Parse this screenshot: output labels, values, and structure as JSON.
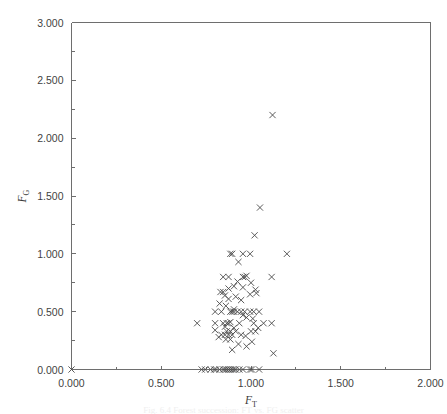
{
  "figure": {
    "background_color": "#ffffff",
    "frame_color": "#6e6e6e",
    "marker_color": "#4a4a4a",
    "caption": "Fig. 6.4  Forest succession: FT vs. FG scatter"
  },
  "axes": {
    "x_title_main": "F",
    "x_title_sub": "T",
    "y_title_main": "F",
    "y_title_sub": "G",
    "x_tick_labels": [
      "0.000",
      "0.500",
      "1.000",
      "1.500",
      "2.000"
    ],
    "y_tick_labels": [
      "0.000",
      "0.500",
      "1.000",
      "1.500",
      "2.000",
      "2.500",
      "3.000"
    ],
    "x_major_values": [
      0.0,
      0.5,
      1.0,
      1.5,
      2.0
    ],
    "y_major_values": [
      0.0,
      0.5,
      1.0,
      1.5,
      2.0,
      2.5,
      3.0
    ],
    "x_minor_values": [
      0.25,
      0.75,
      1.25,
      1.75
    ],
    "y_minor_values": [
      0.25,
      0.75,
      1.25,
      1.75,
      2.25,
      2.75
    ]
  },
  "chart_data": {
    "type": "scatter",
    "title": "",
    "xlabel": "F_T",
    "ylabel": "F_G",
    "xlim": [
      0.0,
      2.0
    ],
    "ylim": [
      0.0,
      3.0
    ],
    "grid": false,
    "legend": null,
    "marker": "x",
    "series": [
      {
        "name": "observations",
        "points": [
          [
            0.0,
            0.0
          ],
          [
            1.12,
            2.2
          ],
          [
            1.05,
            1.4
          ],
          [
            1.02,
            1.16
          ],
          [
            0.885,
            1.0
          ],
          [
            0.895,
            1.0
          ],
          [
            0.955,
            1.0
          ],
          [
            0.995,
            1.0
          ],
          [
            1.2,
            1.0
          ],
          [
            0.93,
            0.93
          ],
          [
            0.845,
            0.8
          ],
          [
            0.875,
            0.8
          ],
          [
            0.955,
            0.8
          ],
          [
            0.965,
            0.8
          ],
          [
            0.975,
            0.81
          ],
          [
            1.115,
            0.8
          ],
          [
            0.925,
            0.76
          ],
          [
            1.0,
            0.75
          ],
          [
            0.905,
            0.72
          ],
          [
            0.955,
            0.71
          ],
          [
            0.875,
            0.7
          ],
          [
            1.025,
            0.69
          ],
          [
            0.83,
            0.67
          ],
          [
            0.845,
            0.67
          ],
          [
            1.03,
            0.66
          ],
          [
            0.995,
            0.65
          ],
          [
            0.855,
            0.64
          ],
          [
            0.915,
            0.63
          ],
          [
            0.875,
            0.61
          ],
          [
            0.945,
            0.6
          ],
          [
            0.825,
            0.57
          ],
          [
            0.86,
            0.55
          ],
          [
            0.905,
            0.52
          ],
          [
            0.8,
            0.5
          ],
          [
            0.835,
            0.5
          ],
          [
            0.885,
            0.5
          ],
          [
            0.895,
            0.5
          ],
          [
            0.905,
            0.5
          ],
          [
            0.925,
            0.5
          ],
          [
            0.945,
            0.5
          ],
          [
            0.965,
            0.5
          ],
          [
            0.995,
            0.5
          ],
          [
            1.015,
            0.5
          ],
          [
            1.045,
            0.5
          ],
          [
            0.955,
            0.47
          ],
          [
            0.975,
            0.45
          ],
          [
            1.01,
            0.44
          ],
          [
            0.7,
            0.4
          ],
          [
            0.8,
            0.4
          ],
          [
            0.845,
            0.4
          ],
          [
            0.865,
            0.4
          ],
          [
            0.875,
            0.4
          ],
          [
            0.885,
            0.41
          ],
          [
            0.935,
            0.4
          ],
          [
            1.015,
            0.4
          ],
          [
            1.07,
            0.4
          ],
          [
            1.115,
            0.4
          ],
          [
            0.855,
            0.37
          ],
          [
            0.905,
            0.36
          ],
          [
            1.04,
            0.36
          ],
          [
            0.8,
            0.34
          ],
          [
            0.865,
            0.33
          ],
          [
            0.885,
            0.33
          ],
          [
            0.915,
            0.33
          ],
          [
            1.0,
            0.33
          ],
          [
            1.025,
            0.33
          ],
          [
            0.835,
            0.3
          ],
          [
            0.855,
            0.3
          ],
          [
            0.875,
            0.3
          ],
          [
            0.895,
            0.3
          ],
          [
            0.945,
            0.3
          ],
          [
            0.97,
            0.29
          ],
          [
            0.82,
            0.28
          ],
          [
            0.86,
            0.26
          ],
          [
            0.885,
            0.26
          ],
          [
            1.005,
            0.24
          ],
          [
            0.93,
            0.22
          ],
          [
            0.975,
            0.2
          ],
          [
            0.895,
            0.17
          ],
          [
            1.125,
            0.14
          ],
          [
            0.725,
            0.0
          ],
          [
            0.745,
            0.0
          ],
          [
            0.775,
            0.0
          ],
          [
            0.795,
            0.0
          ],
          [
            0.805,
            0.0
          ],
          [
            0.825,
            0.0
          ],
          [
            0.845,
            0.0
          ],
          [
            0.855,
            0.0
          ],
          [
            0.865,
            0.0
          ],
          [
            0.875,
            0.0
          ],
          [
            0.885,
            0.0
          ],
          [
            0.895,
            0.0
          ],
          [
            0.905,
            0.0
          ],
          [
            0.915,
            0.0
          ],
          [
            0.935,
            0.0
          ],
          [
            0.955,
            0.0
          ],
          [
            0.995,
            0.0
          ],
          [
            1.005,
            0.0
          ],
          [
            1.045,
            0.0
          ]
        ]
      }
    ]
  }
}
